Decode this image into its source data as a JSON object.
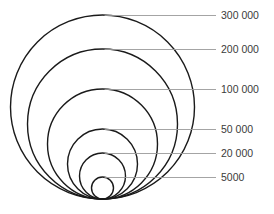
{
  "diagram": {
    "type": "nested-circles",
    "base_point": {
      "x": 102.5,
      "y": 199
    },
    "stroke_color": "#1a1a1a",
    "leader_color": "#9a9a9a",
    "label_color": "#3a3a3a",
    "levels": [
      {
        "label": "300 000",
        "value": 300000,
        "radius": 92,
        "line_y": 15
      },
      {
        "label": "200 000",
        "value": 200000,
        "radius": 75,
        "line_y": 49
      },
      {
        "label": "100 000",
        "value": 100000,
        "radius": 55,
        "line_y": 89
      },
      {
        "label": "50 000",
        "value": 50000,
        "radius": 35,
        "line_y": 129
      },
      {
        "label": "20 000",
        "value": 20000,
        "radius": 23,
        "line_y": 153
      },
      {
        "label": "5000",
        "value": 5000,
        "radius": 11,
        "line_y": 177
      }
    ]
  }
}
